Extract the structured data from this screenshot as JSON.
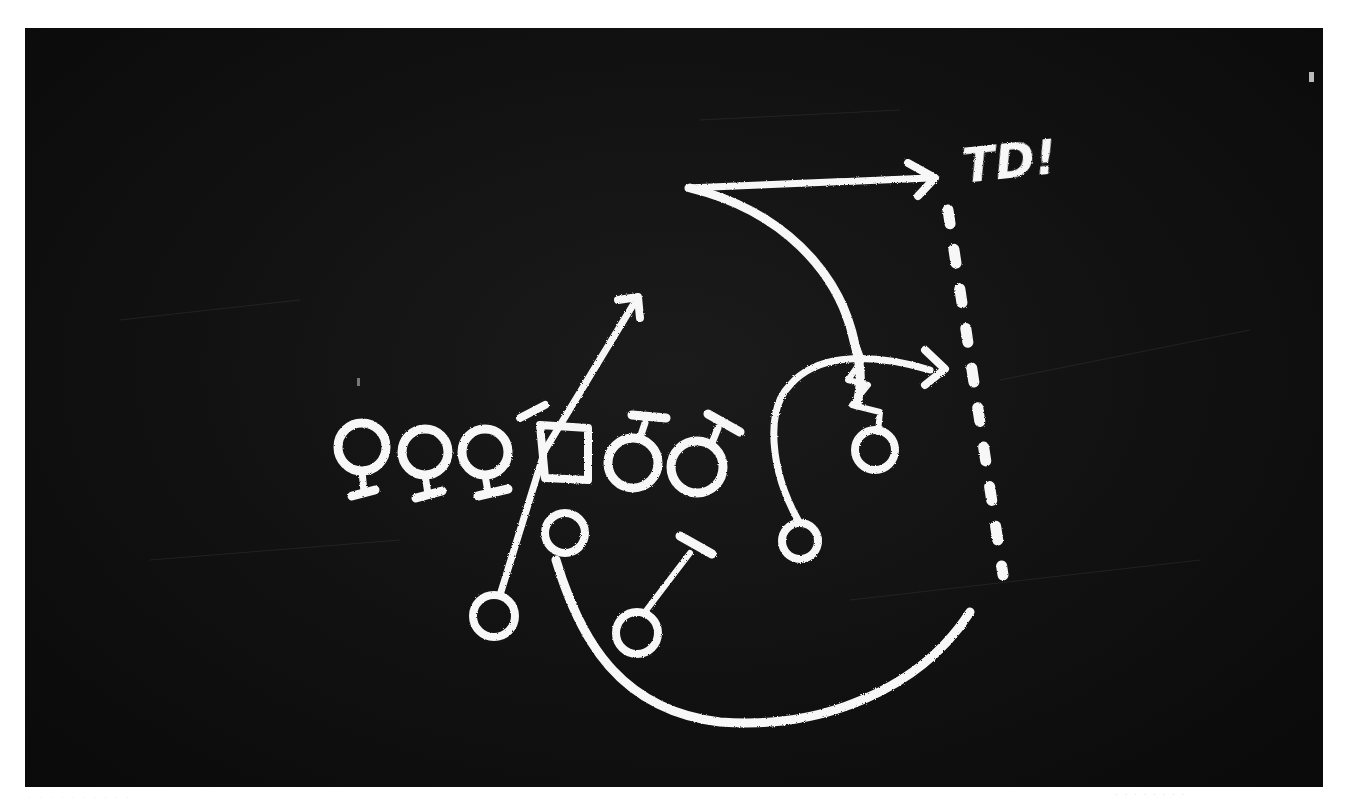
{
  "image": {
    "subject": "chalkboard football play diagram",
    "background_color": "#121212",
    "chalk_color": "#f7f7f7",
    "page_background": "#ffffff"
  },
  "annotation": {
    "label": "TD!"
  },
  "offensive_line": {
    "players": [
      {
        "symbol": "female-sign",
        "x": 360,
        "y": 450
      },
      {
        "symbol": "female-sign",
        "x": 425,
        "y": 452
      },
      {
        "symbol": "female-sign",
        "x": 485,
        "y": 452
      },
      {
        "symbol": "center-square",
        "x": 565,
        "y": 452
      },
      {
        "symbol": "male-sign",
        "x": 638,
        "y": 460
      },
      {
        "symbol": "male-sign",
        "x": 697,
        "y": 462
      }
    ]
  },
  "backs": [
    {
      "name": "qb",
      "x": 565,
      "y": 533
    },
    {
      "name": "running-back-left",
      "x": 494,
      "y": 617
    },
    {
      "name": "running-back-right",
      "x": 637,
      "y": 633
    },
    {
      "name": "receiver-slot",
      "x": 800,
      "y": 540
    },
    {
      "name": "receiver-wide",
      "x": 875,
      "y": 450
    }
  ],
  "routes": [
    {
      "name": "deep-post-to-td",
      "arrow": true
    },
    {
      "name": "curl-out",
      "arrow": true
    },
    {
      "name": "seam-route",
      "arrow": true
    },
    {
      "name": "wheel-route",
      "arrow": false
    },
    {
      "name": "block",
      "arrow": false
    }
  ],
  "end_zone_line": {
    "style": "dashed",
    "dash_count": 9
  },
  "captions": {
    "bottom_left": "· · · · · · · · · ·",
    "bottom_right": "· · · · · · · ·"
  }
}
